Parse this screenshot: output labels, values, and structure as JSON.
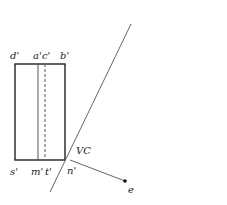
{
  "diagram": {
    "labels": {
      "d": "d'",
      "a": "a'",
      "c": "c'",
      "b": "b'",
      "s": "s'",
      "m": "m'",
      "t": "t'",
      "n": "n'",
      "vc": "VC",
      "e": "e"
    },
    "colors": {
      "stroke": "#222222",
      "line": "#555555",
      "background": "#ffffff"
    }
  }
}
